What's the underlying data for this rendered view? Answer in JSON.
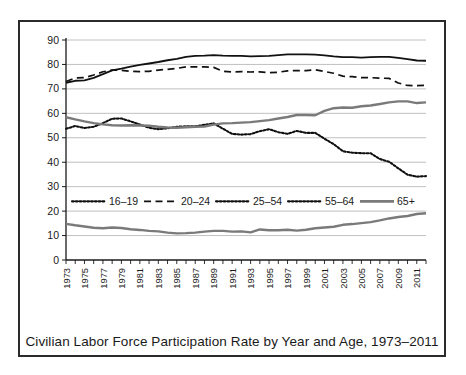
{
  "figure": {
    "caption": "Civilian Labor Force Participation Rate by Year and Age, 1973–2011"
  },
  "colors": {
    "axis": "#1a1a1a",
    "grid": "#b9b9b9",
    "frame": "#2b2b2b",
    "series_black": "#111111",
    "series_gray": "#7a7a7a",
    "background": "#ffffff"
  },
  "chart_data": {
    "type": "line",
    "title": "",
    "subtitle": "",
    "xlabel": "",
    "ylabel": "",
    "grid": "horizontal",
    "legend_position": "inside-middle",
    "ylim": [
      0,
      90
    ],
    "yticks": [
      0,
      10,
      20,
      30,
      40,
      50,
      60,
      70,
      80,
      90
    ],
    "ytick_labels": [
      "0",
      "10",
      "20",
      "30",
      "40",
      "50",
      "60",
      "70",
      "80",
      "90"
    ],
    "xlim": [
      1973,
      2012
    ],
    "xtick_labels": [
      "1973",
      "1975",
      "1977",
      "1979",
      "1981",
      "1983",
      "1985",
      "1987",
      "1989",
      "1991",
      "1993",
      "1995",
      "1997",
      "1999",
      "2001",
      "2003",
      "2005",
      "2007",
      "2009",
      "2011"
    ],
    "x": [
      1973,
      1974,
      1975,
      1976,
      1977,
      1978,
      1979,
      1980,
      1981,
      1982,
      1983,
      1984,
      1985,
      1986,
      1987,
      1988,
      1989,
      1990,
      1991,
      1992,
      1993,
      1994,
      1995,
      1996,
      1997,
      1998,
      1999,
      2000,
      2001,
      2002,
      2003,
      2004,
      2005,
      2006,
      2007,
      2008,
      2009,
      2010,
      2011,
      2012
    ],
    "series": [
      {
        "name": "16–19",
        "style": "dotted",
        "color": "#111111",
        "values": [
          53.7,
          54.8,
          54.0,
          54.5,
          56.0,
          57.8,
          57.9,
          56.7,
          55.4,
          54.1,
          53.5,
          53.9,
          54.5,
          54.7,
          54.7,
          55.3,
          55.9,
          53.7,
          51.6,
          51.3,
          51.5,
          52.7,
          53.5,
          52.3,
          51.6,
          52.8,
          52.0,
          52.0,
          49.6,
          47.4,
          44.5,
          43.9,
          43.7,
          43.7,
          41.3,
          40.2,
          37.5,
          34.9,
          34.1,
          34.3
        ]
      },
      {
        "name": "20–24",
        "style": "dashed",
        "color": "#111111",
        "values": [
          73.0,
          74.5,
          74.6,
          75.7,
          77.0,
          77.7,
          77.6,
          77.2,
          77.1,
          77.2,
          77.7,
          78.0,
          78.4,
          79.0,
          79.0,
          79.0,
          78.8,
          77.2,
          76.9,
          77.1,
          76.9,
          77.0,
          76.6,
          76.8,
          77.4,
          77.5,
          77.5,
          77.8,
          77.1,
          76.4,
          75.2,
          75.0,
          74.6,
          74.6,
          74.4,
          74.3,
          72.4,
          71.4,
          71.3,
          71.5
        ]
      },
      {
        "name": "25–54",
        "style": "solid",
        "color": "#111111",
        "values": [
          72.5,
          73.3,
          73.5,
          74.5,
          76.0,
          77.6,
          78.3,
          79.1,
          79.8,
          80.4,
          81.0,
          81.7,
          82.3,
          83.1,
          83.5,
          83.6,
          83.8,
          83.6,
          83.5,
          83.5,
          83.3,
          83.4,
          83.5,
          83.8,
          84.1,
          84.1,
          84.1,
          84.0,
          83.7,
          83.3,
          83.0,
          83.0,
          82.8,
          83.0,
          83.1,
          83.1,
          82.7,
          82.2,
          81.6,
          81.5
        ]
      },
      {
        "name": "55–64",
        "style": "solid-gray-upper",
        "color": "#7a7a7a",
        "values": [
          58.4,
          57.5,
          56.7,
          56.0,
          55.5,
          55.1,
          55.0,
          55.1,
          55.0,
          54.9,
          54.5,
          54.2,
          54.1,
          54.3,
          54.5,
          54.6,
          55.4,
          55.9,
          56.0,
          56.2,
          56.4,
          56.8,
          57.2,
          57.9,
          58.5,
          59.3,
          59.3,
          59.2,
          61.0,
          62.1,
          62.4,
          62.3,
          62.9,
          63.2,
          63.8,
          64.5,
          64.9,
          64.9,
          64.2,
          64.5
        ]
      },
      {
        "name": "65+",
        "style": "solid-gray-lower",
        "color": "#7a7a7a",
        "values": [
          14.8,
          14.2,
          13.7,
          13.2,
          13.0,
          13.3,
          13.1,
          12.6,
          12.3,
          11.9,
          11.7,
          11.2,
          10.9,
          11.0,
          11.2,
          11.6,
          11.9,
          11.9,
          11.6,
          11.7,
          11.3,
          12.5,
          12.2,
          12.2,
          12.4,
          12.0,
          12.4,
          13.0,
          13.3,
          13.6,
          14.4,
          14.7,
          15.1,
          15.5,
          16.2,
          17.0,
          17.6,
          18.0,
          18.8,
          19.1
        ]
      }
    ]
  },
  "legend": {
    "entries": [
      {
        "label": "16–19",
        "style": "dotted"
      },
      {
        "label": "20–24",
        "style": "dashed"
      },
      {
        "label": "25–54",
        "style": "dotted"
      },
      {
        "label": "55–64",
        "style": "dotted"
      },
      {
        "label": "65+",
        "style": "solid"
      }
    ]
  }
}
